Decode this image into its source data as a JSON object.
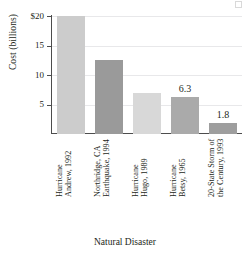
{
  "chart_data": {
    "type": "bar",
    "title": "",
    "xlabel": "Natural Disaster",
    "ylabel": "Cost (billions)",
    "categories": [
      "Hurricane Andrew, 1992",
      "Northridge, CA Earthquake, 1994",
      "Hurricane Hugo, 1989",
      "Hurricane Betsy, 1965",
      "20-State Storm of the Century, 1993"
    ],
    "values": [
      20.0,
      12.5,
      6.9,
      6.3,
      1.8
    ],
    "ylim": [
      0,
      20
    ],
    "yticks": [
      20,
      15,
      10,
      5
    ],
    "ytick_labels": [
      "$20",
      "15",
      "10",
      "5"
    ],
    "grid": true,
    "legend": "none",
    "data_labels": [
      {
        "index": 3,
        "text": "6.3"
      },
      {
        "index": 4,
        "text": "1.8"
      }
    ],
    "bar_colors": [
      "#cccccc",
      "#9a9a9a",
      "#d8d8d8",
      "#aaaaaa",
      "#9e9e9e"
    ]
  },
  "axes": {
    "y_title": "Cost (billions)",
    "x_title": "Natural Disaster",
    "y_tick_labels": [
      "$20",
      "15",
      "10",
      "5"
    ]
  },
  "bars": [
    {
      "label_line1": "Hurricane",
      "label_line2": "Andrew, 1992",
      "value": 20.0,
      "value_label": "",
      "color": "#cccccc"
    },
    {
      "label_line1": "Northridge, CA",
      "label_line2": "Earthquake, 1994",
      "value": 12.5,
      "value_label": "",
      "color": "#9a9a9a"
    },
    {
      "label_line1": "Hurricane",
      "label_line2": "Hugo, 1989",
      "value": 6.9,
      "value_label": "",
      "color": "#d8d8d8"
    },
    {
      "label_line1": "Hurricane",
      "label_line2": "Betsy, 1965",
      "value": 6.3,
      "value_label": "6.3",
      "color": "#aaaaaa"
    },
    {
      "label_line1": "20-State Storm of",
      "label_line2": "the Century, 1993",
      "value": 1.8,
      "value_label": "1.8",
      "color": "#9e9e9e"
    }
  ]
}
